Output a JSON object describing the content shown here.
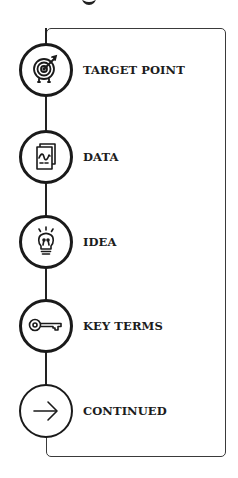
{
  "diagram": {
    "title_fragment": "",
    "frame_color": "#3a3a3a",
    "stroke_color": "#1a1a1a",
    "steps": [
      {
        "label": "TARGET POINT",
        "icon": "target-icon"
      },
      {
        "label": "DATA",
        "icon": "data-document-icon"
      },
      {
        "label": "IDEA",
        "icon": "lightbulb-icon"
      },
      {
        "label": "KEY TERMS",
        "icon": "key-icon"
      },
      {
        "label": "CONTINUED",
        "icon": "arrow-right-icon"
      }
    ]
  }
}
